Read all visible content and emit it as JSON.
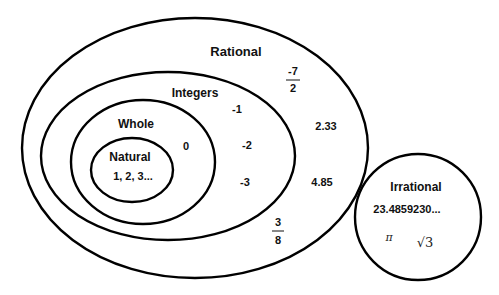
{
  "diagram": {
    "sets": {
      "rational": {
        "label": "Rational",
        "members": {
          "frac1": {
            "numerator": "-7",
            "denominator": "2"
          },
          "dec1": "2.33",
          "dec2": "4.85",
          "frac2": {
            "numerator": "3",
            "denominator": "8"
          }
        }
      },
      "integers": {
        "label": "Integers",
        "members": [
          "-1",
          "-2",
          "-3"
        ]
      },
      "whole": {
        "label": "Whole",
        "members": [
          "0"
        ]
      },
      "natural": {
        "label": "Natural",
        "members": [
          "1, 2, 3..."
        ]
      },
      "irrational": {
        "label": "Irrational",
        "members": {
          "decimal": "23.4859230...",
          "pi": "π",
          "sqrt3": "√3"
        }
      }
    },
    "colors": {
      "stroke": "#000000",
      "text": "#111111",
      "background": "#ffffff"
    }
  }
}
